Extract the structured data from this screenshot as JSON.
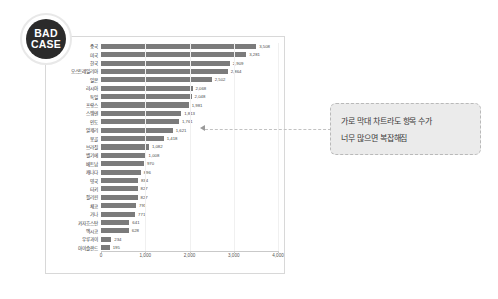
{
  "badge": {
    "line1": "BAD",
    "line2": "CASE"
  },
  "callout": {
    "line1": "가로 막대 차트라도 항목 수가",
    "line2": "너무 많으면 복잡해짐"
  },
  "colors": {
    "bar": "#7b7b7b",
    "badge_bg": "#2b2b2b",
    "callout_bg": "#ebebeb",
    "card_border": "#d8d8d8"
  },
  "chart_data": {
    "type": "bar",
    "orientation": "horizontal",
    "title": "",
    "xlabel": "",
    "ylabel": "",
    "xlim": [
      0,
      4000
    ],
    "grid": true,
    "legend": null,
    "xticks": [
      0,
      1000,
      2000,
      3000,
      4000
    ],
    "xticklabels": [
      "0",
      "1,000",
      "2,000",
      "3,000",
      "4,000"
    ],
    "categories": [
      "중국",
      "미국",
      "한국",
      "오스트레일리아",
      "일본",
      "러시아",
      "독일",
      "프랑스",
      "스웨덴",
      "인도",
      "알제리",
      "몽골",
      "브라질",
      "벨기에",
      "베트남",
      "캐나다",
      "영국",
      "터키",
      "필리핀",
      "체코",
      "가나",
      "카자흐스탄",
      "멕시코",
      "우루과이",
      "아이슬란드"
    ],
    "values": [
      3508,
      3281,
      2909,
      2864,
      2502,
      2068,
      2048,
      1981,
      1813,
      1761,
      1621,
      1418,
      1082,
      1008,
      970,
      896,
      834,
      827,
      827,
      791,
      771,
      641,
      628,
      234,
      195
    ],
    "value_labels": [
      "3,508",
      "3,281",
      "2,909",
      "2,864",
      "2,502",
      "2,068",
      "2,048",
      "1,981",
      "1,813",
      "1,761",
      "1,621",
      "1,418",
      "1,082",
      "1,008",
      "970",
      "896",
      "834",
      "827",
      "827",
      "791",
      "771",
      "641",
      "628",
      "234",
      "195"
    ],
    "annotation_target": "인도"
  }
}
